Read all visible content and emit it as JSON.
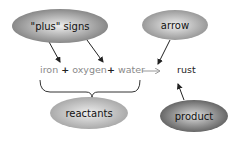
{
  "labels": {
    "plus_signs": "\"plus\" signs",
    "arrow": "arrow",
    "reactants": "reactants",
    "product": "product"
  },
  "equation": {
    "reactant_1": "iron",
    "plus_1": "+",
    "reactant_2": "oxygen",
    "plus_2": "+",
    "reactant_3": "water",
    "arrow_symbol": "→",
    "product": "rust"
  },
  "colors": {
    "cloud_light": "#d0d0d0",
    "cloud_dark": "#8a8a8a",
    "reactant_text": "#8a8a8a",
    "product_text": "#222222"
  }
}
